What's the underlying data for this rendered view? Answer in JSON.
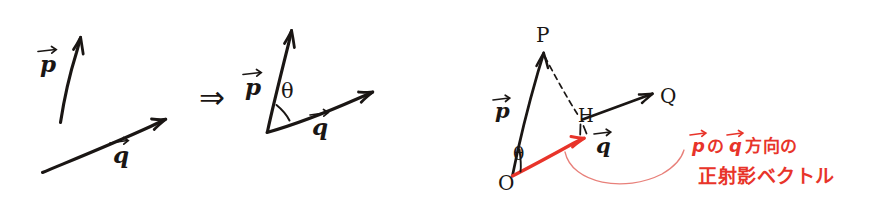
{
  "figure": {
    "background_color": "#ffffff",
    "ink_color": "#1a1614",
    "accent_color": "#e8342a",
    "accent_light_color": "#e8807a",
    "panels": [
      {
        "id": "panel-left",
        "name": "two-separate-vectors",
        "labels": [
          {
            "name": "vector-p-label",
            "text": "p",
            "accent": false
          },
          {
            "name": "vector-q-label",
            "text": "q",
            "accent": false
          }
        ]
      },
      {
        "id": "panel-middle",
        "name": "vectors-sharing-origin-with-angle",
        "labels": [
          {
            "name": "vector-p-label",
            "text": "p",
            "accent": false
          },
          {
            "name": "vector-q-label",
            "text": "q",
            "accent": false
          },
          {
            "name": "angle-theta-label",
            "text": "θ",
            "accent": false
          }
        ]
      },
      {
        "id": "panel-right",
        "name": "projection-construction",
        "labels": [
          {
            "name": "point-p-label",
            "text": "P",
            "accent": false
          },
          {
            "name": "point-h-label",
            "text": "H",
            "accent": false
          },
          {
            "name": "point-q-label",
            "text": "Q",
            "accent": false
          },
          {
            "name": "point-o-label",
            "text": "O",
            "accent": false
          },
          {
            "name": "vector-p-label",
            "text": "p",
            "accent": false
          },
          {
            "name": "vector-q-label",
            "text": "q",
            "accent": false
          },
          {
            "name": "angle-theta-label",
            "text": "θ",
            "accent": false
          }
        ]
      }
    ],
    "implication_symbol": "⇒",
    "annotation": {
      "name": "projection-annotation",
      "color": "#e8342a",
      "line1_prefix": "p",
      "line1_middle": "の",
      "line1_vec2": "q",
      "line1_suffix": "方向の",
      "line2": "正射影ベクトル",
      "full_text": "pのq方向の正射影ベクトル"
    }
  }
}
